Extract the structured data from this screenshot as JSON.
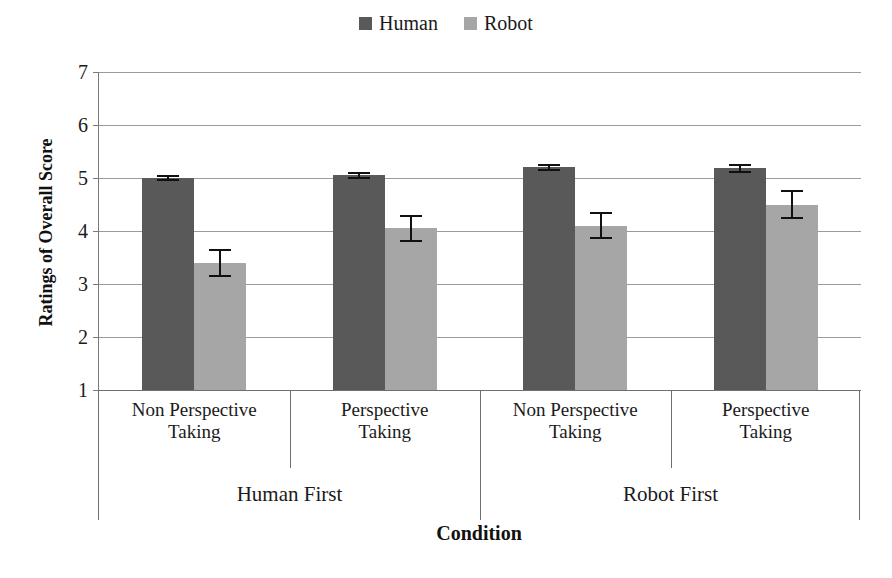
{
  "chart_data": {
    "type": "bar",
    "title": "",
    "xlabel": "Condition",
    "ylabel": "Ratings of Overall Score",
    "ylim": [
      1,
      7
    ],
    "ytick_labels": [
      "7",
      "6",
      "5",
      "4",
      "3",
      "2",
      "1"
    ],
    "ytick_values": [
      7,
      6,
      5,
      4,
      3,
      2,
      1
    ],
    "grid": true,
    "legend_position": "top-center",
    "categories": [
      "Non Perspective Taking",
      "Perspective Taking",
      "Non Perspective Taking",
      "Perspective Taking"
    ],
    "category_lines": [
      [
        "Non Perspective",
        "Taking"
      ],
      [
        "Perspective",
        "Taking"
      ],
      [
        "Non Perspective",
        "Taking"
      ],
      [
        "Perspective",
        "Taking"
      ]
    ],
    "groups": [
      {
        "label": "Human First",
        "categories": [
          0,
          1
        ]
      },
      {
        "label": "Robot First",
        "categories": [
          2,
          3
        ]
      }
    ],
    "series": [
      {
        "name": "Human",
        "color": "#595959",
        "values": [
          5.0,
          5.05,
          5.2,
          5.18
        ],
        "errors": [
          0.06,
          0.07,
          0.07,
          0.08
        ]
      },
      {
        "name": "Robot",
        "color": "#a6a6a6",
        "values": [
          3.4,
          4.05,
          4.1,
          4.5
        ],
        "errors": [
          0.26,
          0.25,
          0.25,
          0.27
        ]
      }
    ]
  },
  "legend": {
    "entries": [
      {
        "label": "Human",
        "color": "#595959",
        "swatch_name": "legend-swatch-human"
      },
      {
        "label": "Robot",
        "color": "#a6a6a6",
        "swatch_name": "legend-swatch-robot"
      }
    ]
  },
  "axes": {
    "y_title": "Ratings of Overall Score",
    "x_title": "Condition"
  }
}
